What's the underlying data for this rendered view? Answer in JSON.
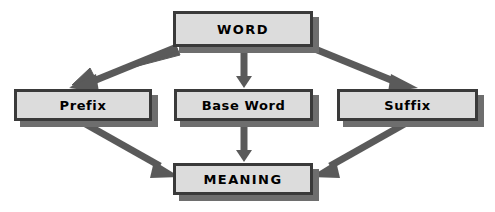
{
  "diagram": {
    "canvas": {
      "width": 495,
      "height": 212,
      "background": "#ffffff"
    },
    "style": {
      "box_fill": "#dcdcdc",
      "box_border": "#3a3a3a",
      "shadow_color": "#6e6e6e",
      "arrow_color": "#5a5a5a",
      "text_color": "#000000"
    },
    "nodes": [
      {
        "id": "word",
        "label": "WORD",
        "caps": true,
        "x": 173,
        "y": 11,
        "width": 140,
        "height": 36
      },
      {
        "id": "prefix",
        "label": "Prefix",
        "caps": false,
        "x": 14,
        "y": 89,
        "width": 138,
        "height": 32
      },
      {
        "id": "base-word",
        "label": "Base Word",
        "caps": false,
        "x": 174,
        "y": 89,
        "width": 139,
        "height": 32
      },
      {
        "id": "suffix",
        "label": "Suffix",
        "caps": false,
        "x": 337,
        "y": 89,
        "width": 141,
        "height": 32
      },
      {
        "id": "meaning",
        "label": "MEANING",
        "caps": true,
        "x": 173,
        "y": 163,
        "width": 140,
        "height": 32
      }
    ],
    "arrows": [
      {
        "id": "word-to-prefix",
        "from": "word",
        "to": "prefix",
        "path": "M 176,48 L 89,82",
        "head": "down-left"
      },
      {
        "id": "word-to-base-word",
        "from": "word",
        "to": "base-word",
        "path": "M 244,48 L 244,82",
        "head": "down"
      },
      {
        "id": "word-to-suffix",
        "from": "word",
        "to": "suffix",
        "path": "M 310,48 L 400,82",
        "head": "down-right"
      },
      {
        "id": "prefix-to-meaning",
        "from": "prefix",
        "to": "meaning",
        "path": "M 80,123 L 165,172",
        "head": "down-right"
      },
      {
        "id": "base-word-to-meaning",
        "from": "base-word",
        "to": "meaning",
        "path": "M 244,123 L 244,158",
        "head": "down"
      },
      {
        "id": "suffix-to-meaning",
        "from": "suffix",
        "to": "meaning",
        "path": "M 410,123 L 325,172",
        "head": "down-left"
      }
    ]
  }
}
